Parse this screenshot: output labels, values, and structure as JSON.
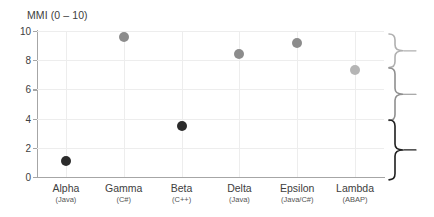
{
  "chart_data": {
    "type": "scatter",
    "title": "MMI (0 – 10)",
    "xlabel": "",
    "ylabel": "",
    "ylim": [
      0,
      10
    ],
    "ytick_labels": [
      "0",
      "2",
      "4",
      "6",
      "8",
      "10"
    ],
    "ytick_values": [
      0,
      2,
      4,
      6,
      8,
      10
    ],
    "grid": true,
    "legend": "none",
    "categories": [
      "Alpha",
      "Gamma",
      "Beta",
      "Delta",
      "Epsilon",
      "Lambda"
    ],
    "category_sublabels": [
      "(Java)",
      "(C#)",
      "(C++)",
      "(Java)",
      "(Java/C#)",
      "(ABAP)"
    ],
    "values": [
      1.1,
      9.6,
      3.5,
      8.4,
      9.2,
      7.3
    ],
    "point_colors": [
      "#2b2b2b",
      "#8c8c8c",
      "#2b2b2b",
      "#8c8c8c",
      "#8c8c8c",
      "#b5b5b5"
    ],
    "annotations": [
      {
        "name": "top-band-brace",
        "from": 9.8,
        "to": 7.5,
        "color": "#b0b0b0"
      },
      {
        "name": "middle-band-brace",
        "from": 7.5,
        "to": 3.9,
        "color": "#8f8f8f"
      },
      {
        "name": "bottom-band-brace",
        "from": 3.9,
        "to": -0.2,
        "color": "#1f1f1f"
      }
    ]
  },
  "colors": {
    "axis": "#a6a6a6",
    "grid": "#ededed",
    "text": "#404040",
    "subtext": "#545454",
    "background": "#ffffff"
  }
}
